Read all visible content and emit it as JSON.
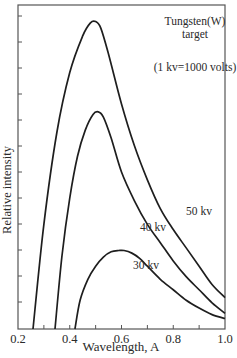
{
  "chart_data": {
    "type": "line",
    "title": "",
    "xlabel": "Wavelength, A",
    "ylabel": "Relative intensity",
    "xlim": [
      0.2,
      1.0
    ],
    "ylim": [
      0,
      12
    ],
    "x_ticks": [
      "0.2",
      "0.4",
      "0.6",
      "0.8",
      "1.0"
    ],
    "x_minor_step": 0.1,
    "y_tick_labels": [],
    "y_tick_count": 12,
    "grid": false,
    "annotations": [
      {
        "text": "Tungsten(W)",
        "x": 0.88,
        "y": 11.0
      },
      {
        "text": "target",
        "x": 0.88,
        "y": 10.5
      },
      {
        "text": "(1  kv=1000  volts)",
        "x": 0.88,
        "y": 9.5
      },
      {
        "text": "50  kv",
        "x": 0.85,
        "y": 3.5
      },
      {
        "text": "40  kv",
        "x": 0.74,
        "y": 2.9
      },
      {
        "text": "30  kv",
        "x": 0.72,
        "y": 1.7
      }
    ],
    "series": [
      {
        "name": "50 kv",
        "x": [
          0.258,
          0.3,
          0.35,
          0.4,
          0.45,
          0.48,
          0.5,
          0.52,
          0.55,
          0.6,
          0.65,
          0.7,
          0.75,
          0.8,
          0.85,
          0.9,
          0.95,
          1.0
        ],
        "y": [
          0.0,
          4.0,
          7.5,
          9.8,
          11.2,
          11.7,
          11.75,
          11.5,
          10.5,
          8.6,
          7.0,
          5.7,
          4.6,
          3.8,
          3.1,
          2.4,
          1.7,
          1.2
        ]
      },
      {
        "name": "40 kv",
        "x": [
          0.343,
          0.37,
          0.4,
          0.43,
          0.46,
          0.49,
          0.51,
          0.53,
          0.56,
          0.6,
          0.65,
          0.7,
          0.75,
          0.8,
          0.85,
          0.9,
          0.95,
          1.0
        ],
        "y": [
          0.0,
          2.8,
          5.0,
          6.6,
          7.6,
          8.2,
          8.3,
          8.1,
          7.3,
          6.0,
          4.9,
          4.0,
          3.3,
          2.6,
          2.0,
          1.5,
          1.0,
          0.6
        ]
      },
      {
        "name": "30 kv",
        "x": [
          0.42,
          0.44,
          0.47,
          0.5,
          0.53,
          0.56,
          0.59,
          0.61,
          0.64,
          0.67,
          0.7,
          0.75,
          0.8,
          0.85,
          0.9,
          0.95,
          1.0
        ],
        "y": [
          0.0,
          1.1,
          1.9,
          2.4,
          2.75,
          2.95,
          3.0,
          3.0,
          2.9,
          2.7,
          2.4,
          1.9,
          1.5,
          1.1,
          0.8,
          0.55,
          0.4
        ]
      }
    ],
    "colors": {
      "line": "#1e1e1e",
      "axis": "#555555",
      "text": "#2a2a2a"
    }
  }
}
